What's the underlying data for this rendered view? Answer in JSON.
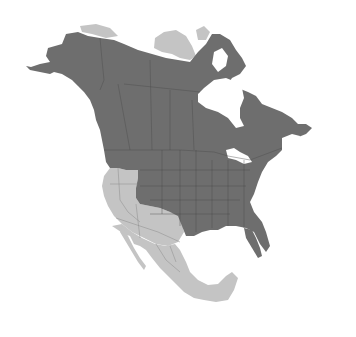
{
  "map": {
    "region": "North America",
    "type": "species range map",
    "legend": [],
    "colors": {
      "range": "#6e6e6e",
      "outside_range": "#c4c4c4",
      "background": "#ffffff"
    },
    "range_areas": [
      "Alaska",
      "Canada (mainland)",
      "Eastern and Central United States",
      "Pacific Northwest"
    ],
    "outside_areas": [
      "California / Great Basin",
      "Southwestern United States",
      "Mexico",
      "Canadian Arctic Archipelago (partial)",
      "Northern Yukon coast"
    ]
  }
}
